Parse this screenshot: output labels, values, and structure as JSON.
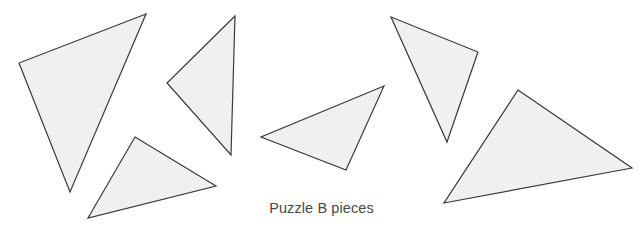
{
  "figure": {
    "caption": "Puzzle B pieces",
    "background_color": "#ffffff",
    "caption_color": "#4a4a4a",
    "width": 643,
    "height": 230
  },
  "style": {
    "piece_fill": "#f0f0f0",
    "piece_stroke": "#3a3a3a",
    "piece_stroke_width": 1.2
  },
  "chart_data": {
    "type": "diagram",
    "title": "Puzzle B pieces",
    "shape_kind": "triangle",
    "count": 6,
    "units": "pixels",
    "xlim": [
      0,
      643
    ],
    "ylim": [
      0,
      230
    ],
    "grid": false,
    "legend": null,
    "pieces": [
      {
        "id": "piece-1",
        "label": "large-left-triangle",
        "points": "146,14 19,63 70,192",
        "vertices": [
          [
            146,
            14
          ],
          [
            19,
            63
          ],
          [
            70,
            192
          ]
        ]
      },
      {
        "id": "piece-2",
        "label": "narrow-upper-middle-triangle",
        "points": "235,16 167,83 231,155",
        "vertices": [
          [
            235,
            16
          ],
          [
            167,
            83
          ],
          [
            231,
            155
          ]
        ]
      },
      {
        "id": "piece-3",
        "label": "lower-left-triangle",
        "points": "135,137 216,186 88,218",
        "vertices": [
          [
            135,
            137
          ],
          [
            216,
            186
          ],
          [
            88,
            218
          ]
        ]
      },
      {
        "id": "piece-4",
        "label": "center-triangle",
        "points": "384,86 261,137 346,170",
        "vertices": [
          [
            384,
            86
          ],
          [
            261,
            137
          ],
          [
            346,
            170
          ]
        ]
      },
      {
        "id": "piece-5",
        "label": "narrow-right-triangle",
        "points": "391,17 478,52 447,142",
        "vertices": [
          [
            391,
            17
          ],
          [
            478,
            52
          ],
          [
            447,
            142
          ]
        ]
      },
      {
        "id": "piece-6",
        "label": "large-right-triangle",
        "points": "518,90 632,168 444,203",
        "vertices": [
          [
            518,
            90
          ],
          [
            632,
            168
          ],
          [
            444,
            203
          ]
        ]
      }
    ]
  }
}
